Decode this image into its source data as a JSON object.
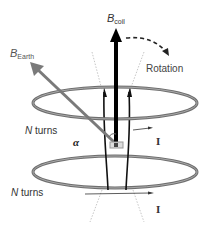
{
  "diagram": {
    "labels": {
      "b_coil": "B",
      "b_coil_sub": "coil",
      "b_earth": "B",
      "b_earth_sub": "Earth",
      "rotation": "Rotation",
      "n_turns_top": "N turns",
      "n_turns_top_n": "N",
      "n_turns_top_rest": " turns",
      "n_turns_bottom_n": "N",
      "n_turns_bottom_rest": " turns",
      "alpha": "α",
      "current_top": "I",
      "current_bottom": "I"
    },
    "colors": {
      "coil": "#6e6e6e",
      "coil_light": "#9a9a9a",
      "b_coil_arrow": "#000000",
      "b_earth_arrow": "#7a7a7a",
      "field_lines": "#111111",
      "dotted_lines": "#b0b0b0",
      "text": "#333333"
    }
  }
}
